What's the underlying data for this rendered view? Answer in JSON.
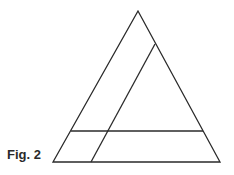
{
  "figure": {
    "caption": "Fig. 2",
    "stroke_color": "#2a2a2a",
    "triangle": {
      "apex": [
        138,
        11
      ],
      "bottom_left": [
        53,
        162
      ],
      "bottom_right": [
        220,
        162
      ]
    },
    "inner_slanted_line": {
      "top": [
        155,
        44
      ],
      "bottom": [
        91,
        162
      ]
    },
    "horizontal_line": {
      "left": [
        71,
        131
      ],
      "right": [
        203,
        131
      ]
    }
  }
}
